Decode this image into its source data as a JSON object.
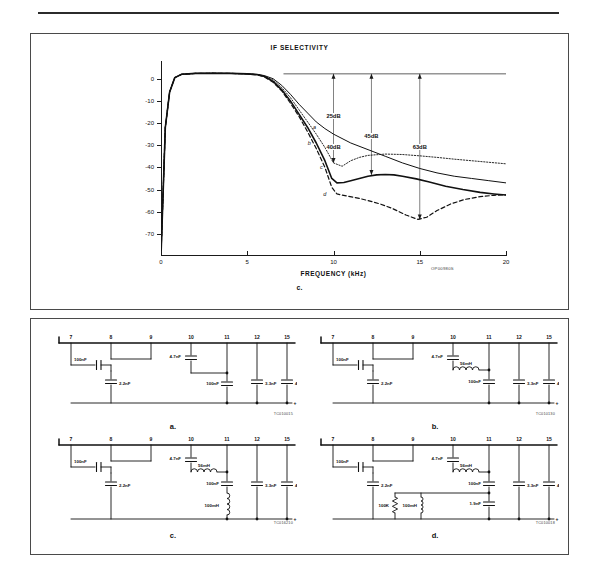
{
  "page": {
    "figure12_caption": "Figure 12 (Continued)",
    "figure12_subletter": "c.",
    "figure13_caption": "Figure 13"
  },
  "chart_data": {
    "type": "line",
    "title": "IF SELECTIVITY",
    "xlabel": "FREQUENCY (kHz)",
    "ylabel": "",
    "xlim": [
      0,
      20
    ],
    "ylim": [
      -80,
      8
    ],
    "grid": false,
    "legend": "inline-curve-labels",
    "xticks": [
      "0",
      "5",
      "10",
      "15",
      "20"
    ],
    "xtick_values": [
      0,
      5,
      10,
      15,
      20
    ],
    "yticks": [
      "0",
      "-10",
      "-20",
      "-30",
      "-40",
      "-50",
      "-60",
      "-70"
    ],
    "ytick_values": [
      0,
      -10,
      -20,
      -30,
      -40,
      -50,
      -60,
      -70
    ],
    "annotations": [
      {
        "label": "25dB",
        "x": 10,
        "y": -17
      },
      {
        "label": "40dB",
        "x": 10,
        "y": -31
      },
      {
        "label": "45dB",
        "x": 12.2,
        "y": -26
      },
      {
        "label": "63dB",
        "x": 15,
        "y": -31
      }
    ],
    "curve_labels": [
      {
        "label": "a",
        "x": 8.9,
        "y": -22
      },
      {
        "label": "b",
        "x": 8.6,
        "y": -29
      },
      {
        "label": "c",
        "x": 9.3,
        "y": -40
      },
      {
        "label": "d",
        "x": 9.5,
        "y": -52
      }
    ],
    "series": [
      {
        "name": "a",
        "style": "solid",
        "points": [
          [
            0,
            -80
          ],
          [
            0.25,
            -22
          ],
          [
            0.5,
            -6
          ],
          [
            0.8,
            0.5
          ],
          [
            1.2,
            2
          ],
          [
            2,
            2.4
          ],
          [
            3,
            2.5
          ],
          [
            4,
            2.4
          ],
          [
            5,
            2.2
          ],
          [
            5.6,
            2
          ],
          [
            6,
            1.4
          ],
          [
            6.5,
            0
          ],
          [
            7,
            -3
          ],
          [
            7.5,
            -7
          ],
          [
            8,
            -11.5
          ],
          [
            8.5,
            -15.5
          ],
          [
            9,
            -19.5
          ],
          [
            9.5,
            -22.5
          ],
          [
            10,
            -25
          ],
          [
            11,
            -29
          ],
          [
            12,
            -32
          ],
          [
            13,
            -35
          ],
          [
            14,
            -38
          ],
          [
            15,
            -40.5
          ],
          [
            16,
            -42.5
          ],
          [
            17,
            -44
          ],
          [
            18,
            -45
          ],
          [
            19,
            -46
          ],
          [
            20,
            -47
          ]
        ]
      },
      {
        "name": "b",
        "style": "dotted",
        "points": [
          [
            0,
            -80
          ],
          [
            0.25,
            -22
          ],
          [
            0.5,
            -6
          ],
          [
            0.8,
            0.5
          ],
          [
            1.2,
            2
          ],
          [
            2,
            2.4
          ],
          [
            3,
            2.5
          ],
          [
            4,
            2.4
          ],
          [
            5,
            2.2
          ],
          [
            5.6,
            1.9
          ],
          [
            6,
            1.2
          ],
          [
            6.5,
            -0.6
          ],
          [
            7,
            -4
          ],
          [
            7.5,
            -8.5
          ],
          [
            8,
            -14
          ],
          [
            8.5,
            -19.5
          ],
          [
            9,
            -25
          ],
          [
            9.5,
            -31
          ],
          [
            10,
            -38
          ],
          [
            10.5,
            -39.5
          ],
          [
            11,
            -37
          ],
          [
            11.5,
            -35.5
          ],
          [
            12,
            -34.6
          ],
          [
            13,
            -34
          ],
          [
            14,
            -34.2
          ],
          [
            15,
            -34.8
          ],
          [
            16,
            -35.5
          ],
          [
            17,
            -36.3
          ],
          [
            18,
            -37
          ],
          [
            19,
            -37.7
          ],
          [
            20,
            -38.4
          ]
        ]
      },
      {
        "name": "c",
        "style": "solid-thick",
        "points": [
          [
            0,
            -80
          ],
          [
            0.25,
            -22
          ],
          [
            0.5,
            -6
          ],
          [
            0.8,
            0.5
          ],
          [
            1.2,
            2
          ],
          [
            2,
            2.4
          ],
          [
            3,
            2.5
          ],
          [
            4,
            2.4
          ],
          [
            5,
            2.2
          ],
          [
            5.6,
            1.8
          ],
          [
            6,
            1
          ],
          [
            6.5,
            -1.2
          ],
          [
            7,
            -5
          ],
          [
            7.5,
            -10
          ],
          [
            8,
            -16
          ],
          [
            8.5,
            -22
          ],
          [
            9,
            -29
          ],
          [
            9.5,
            -37
          ],
          [
            9.9,
            -45
          ],
          [
            10.2,
            -47
          ],
          [
            10.6,
            -46.8
          ],
          [
            11,
            -46
          ],
          [
            11.5,
            -45
          ],
          [
            12,
            -44
          ],
          [
            12.5,
            -43.4
          ],
          [
            13,
            -43.2
          ],
          [
            13.5,
            -43.4
          ],
          [
            14,
            -44
          ],
          [
            14.8,
            -45.2
          ],
          [
            15.5,
            -46.5
          ],
          [
            16.5,
            -48.5
          ],
          [
            17.5,
            -50
          ],
          [
            18.5,
            -51.3
          ],
          [
            19.3,
            -52
          ],
          [
            20,
            -52.5
          ]
        ]
      },
      {
        "name": "d",
        "style": "dashed",
        "points": [
          [
            0,
            -80
          ],
          [
            0.25,
            -22
          ],
          [
            0.5,
            -6
          ],
          [
            0.8,
            0.5
          ],
          [
            1.2,
            2
          ],
          [
            2,
            2.4
          ],
          [
            3,
            2.5
          ],
          [
            4,
            2.4
          ],
          [
            5,
            2.2
          ],
          [
            5.6,
            1.7
          ],
          [
            6,
            0.8
          ],
          [
            6.5,
            -1.6
          ],
          [
            7,
            -5.5
          ],
          [
            7.5,
            -11
          ],
          [
            8,
            -17
          ],
          [
            8.5,
            -24
          ],
          [
            9,
            -31.5
          ],
          [
            9.5,
            -40
          ],
          [
            9.9,
            -49
          ],
          [
            10.2,
            -52
          ],
          [
            10.8,
            -53
          ],
          [
            11.5,
            -54
          ],
          [
            12,
            -55
          ],
          [
            12.7,
            -56.5
          ],
          [
            13.4,
            -58.5
          ],
          [
            14.2,
            -61.5
          ],
          [
            14.9,
            -63.5
          ],
          [
            15.4,
            -62.5
          ],
          [
            16,
            -59.5
          ],
          [
            16.8,
            -56.5
          ],
          [
            17.6,
            -54.5
          ],
          [
            18.5,
            -53.2
          ],
          [
            19.3,
            -52.6
          ],
          [
            20,
            -52.4
          ]
        ]
      }
    ],
    "reference_line_y": 2.2,
    "dropline_x": [
      10,
      12.2,
      15
    ],
    "source_code": "OP00980S"
  },
  "circuits": [
    {
      "id": "a",
      "letter": "a.",
      "code": "TC010015",
      "pins": [
        "7",
        "8",
        "9",
        "10",
        "11",
        "12",
        "15"
      ],
      "components": [
        {
          "ref": "C1",
          "value": "100nF",
          "type": "capacitor"
        },
        {
          "ref": "C2",
          "value": "2.2nF",
          "type": "capacitor"
        },
        {
          "ref": "C3",
          "value": "4.7nF",
          "type": "capacitor"
        },
        {
          "ref": "C4",
          "value": "100nF",
          "type": "capacitor"
        },
        {
          "ref": "C5",
          "value": "3.3nF",
          "type": "capacitor"
        },
        {
          "ref": "C6",
          "value": "4.7 µF",
          "type": "capacitor"
        }
      ]
    },
    {
      "id": "b",
      "letter": "b.",
      "code": "TC010130",
      "pins": [
        "7",
        "8",
        "9",
        "10",
        "11",
        "12",
        "15"
      ],
      "components": [
        {
          "ref": "C1",
          "value": "100nF",
          "type": "capacitor"
        },
        {
          "ref": "C2",
          "value": "2.2nF",
          "type": "capacitor"
        },
        {
          "ref": "C3",
          "value": "4.7nF",
          "type": "capacitor"
        },
        {
          "ref": "L1",
          "value": "56mH",
          "type": "inductor"
        },
        {
          "ref": "C4",
          "value": "100nF",
          "type": "capacitor"
        },
        {
          "ref": "C5",
          "value": "3.3nF",
          "type": "capacitor"
        },
        {
          "ref": "C6",
          "value": "4.7 µF",
          "type": "capacitor"
        }
      ]
    },
    {
      "id": "c",
      "letter": "c.",
      "code": "TC016210",
      "pins": [
        "7",
        "8",
        "9",
        "10",
        "11",
        "12",
        "15"
      ],
      "components": [
        {
          "ref": "C1",
          "value": "100nF",
          "type": "capacitor"
        },
        {
          "ref": "C2",
          "value": "2.2nF",
          "type": "capacitor"
        },
        {
          "ref": "C3",
          "value": "4.7nF",
          "type": "capacitor"
        },
        {
          "ref": "L1",
          "value": "56mH",
          "type": "inductor"
        },
        {
          "ref": "C4",
          "value": "100nF",
          "type": "capacitor"
        },
        {
          "ref": "L2",
          "value": "100mH",
          "type": "inductor"
        },
        {
          "ref": "C5",
          "value": "3.3nF",
          "type": "capacitor"
        },
        {
          "ref": "C6",
          "value": "4.7 µF",
          "type": "capacitor"
        }
      ]
    },
    {
      "id": "d",
      "letter": "d.",
      "code": "TC010018",
      "pins": [
        "7",
        "8",
        "9",
        "10",
        "11",
        "12",
        "15"
      ],
      "components": [
        {
          "ref": "C1",
          "value": "100nF",
          "type": "capacitor"
        },
        {
          "ref": "C2",
          "value": "2.2nF",
          "type": "capacitor"
        },
        {
          "ref": "C3",
          "value": "4.7nF",
          "type": "capacitor"
        },
        {
          "ref": "L1",
          "value": "56mH",
          "type": "inductor"
        },
        {
          "ref": "C4",
          "value": "100nF",
          "type": "capacitor"
        },
        {
          "ref": "R1",
          "value": "100K",
          "type": "resistor"
        },
        {
          "ref": "L2",
          "value": "100mH",
          "type": "inductor"
        },
        {
          "ref": "C5",
          "value": "1.9nF",
          "type": "capacitor"
        },
        {
          "ref": "C6",
          "value": "3.3nF",
          "type": "capacitor"
        },
        {
          "ref": "C7",
          "value": "4.7 µF",
          "type": "capacitor"
        }
      ]
    }
  ]
}
